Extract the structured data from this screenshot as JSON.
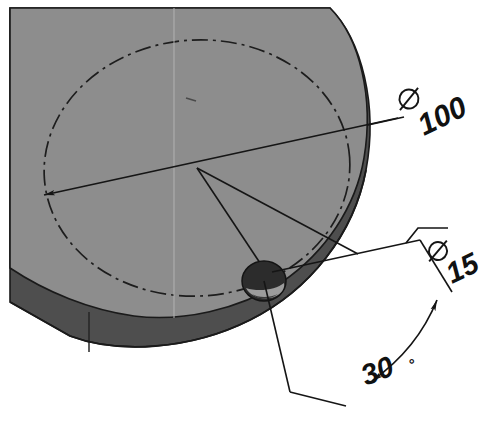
{
  "drawing": {
    "title": "Isometric view of cylindrical boss block with bolt hole",
    "background_color": "#ffffff",
    "line_color": "#1a1a1a",
    "faces": {
      "top_face": {
        "name": "top-face",
        "color": "#8d8d8d",
        "description": "upper planar face of block, mid gray"
      },
      "side_face": {
        "name": "side-face",
        "color": "#4e4e4e",
        "description": "cylindrical side wall of block, dark gray"
      },
      "hole_bore": {
        "name": "hole-bore",
        "color": "#2e2e2e"
      },
      "hole_highlight": {
        "name": "hole-highlight",
        "color": "#9a9a9a"
      }
    },
    "dimensions": [
      {
        "id": "dia-100",
        "symbol": "⌀",
        "value": "100",
        "label": "⌀ 100",
        "kind": "diameter",
        "target": "bolt circle",
        "text_x": 418,
        "text_y": 130,
        "rotation": -26
      },
      {
        "id": "dia-15",
        "symbol": "⌀",
        "value": "15",
        "label": "⌀ 15",
        "kind": "diameter",
        "target": "through hole",
        "text_x": 443,
        "text_y": 278,
        "rotation": -26
      },
      {
        "id": "angle-30",
        "symbol": "°",
        "value": "30",
        "label": "30°",
        "kind": "angle",
        "target": "hole angular position",
        "text_x": 371,
        "text_y": 383,
        "rotation": -22
      }
    ],
    "geometry": {
      "bolt_circle_style": "dash-dot centerline",
      "center_point": {
        "x": 197,
        "y": 168
      },
      "hole_center": {
        "x": 264,
        "y": 281
      },
      "hole_radius": 21
    }
  }
}
